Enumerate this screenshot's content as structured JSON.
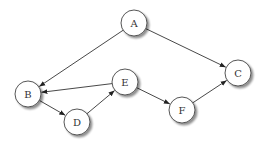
{
  "diagram": {
    "type": "directed-graph",
    "node_radius": 13,
    "colors": {
      "stroke": "#444444",
      "fill": "#ffffff",
      "shadow": "#bdbdbd",
      "edge": "#333333",
      "label": "#333333"
    },
    "nodes": [
      {
        "id": "A",
        "label": "A",
        "x": 134,
        "y": 23
      },
      {
        "id": "B",
        "label": "B",
        "x": 28,
        "y": 94
      },
      {
        "id": "C",
        "label": "C",
        "x": 238,
        "y": 73
      },
      {
        "id": "D",
        "label": "D",
        "x": 77,
        "y": 122
      },
      {
        "id": "E",
        "label": "E",
        "x": 125,
        "y": 82
      },
      {
        "id": "F",
        "label": "F",
        "x": 182,
        "y": 110
      }
    ],
    "edges": [
      {
        "from": "A",
        "to": "B"
      },
      {
        "from": "A",
        "to": "C"
      },
      {
        "from": "E",
        "to": "B"
      },
      {
        "from": "B",
        "to": "D"
      },
      {
        "from": "D",
        "to": "E"
      },
      {
        "from": "E",
        "to": "F"
      },
      {
        "from": "F",
        "to": "C"
      }
    ]
  }
}
